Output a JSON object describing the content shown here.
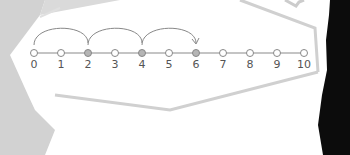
{
  "diagram": {
    "type": "number-line-skip-counting",
    "start": 0,
    "end": 10,
    "step_labels": [
      "0",
      "1",
      "2",
      "3",
      "4",
      "5",
      "6",
      "7",
      "8",
      "9",
      "10"
    ],
    "highlighted": [
      2,
      4,
      6
    ],
    "jumps": [
      {
        "from": 0,
        "to": 2
      },
      {
        "from": 2,
        "to": 4
      },
      {
        "from": 4,
        "to": 6
      }
    ],
    "jump_size": 2
  },
  "colors": {
    "background_left": "#cfcfcf",
    "card_fill": "#ffffff",
    "card_border": "#d4d4d4",
    "line": "#888888",
    "open_dot_stroke": "#888888",
    "filled_dot": "#b5b5b5",
    "label": "#555555",
    "arc": "#888888",
    "dark_shape": "#0a0a0a"
  }
}
